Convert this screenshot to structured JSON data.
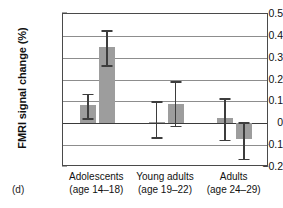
{
  "figure": {
    "panel_letter": "(d)",
    "ylabel": "FMRI signal change (%)"
  },
  "axis": {
    "y_ticks": [
      "0.5",
      "0.4",
      "0.3",
      "0.2",
      "0.1",
      "0",
      "−0.1",
      "−0.2"
    ]
  },
  "categories": [
    {
      "name": "Adolescents",
      "age": "(age 14–18)"
    },
    {
      "name": "Young adults",
      "age": "(age 19–22)"
    },
    {
      "name": "Adults",
      "age": "(age 24–29)"
    }
  ],
  "chart_data": {
    "type": "bar",
    "title": "",
    "xlabel": "",
    "ylabel": "FMRI signal change (%)",
    "ylim": [
      -0.2,
      0.5
    ],
    "ytick_values": [
      0.5,
      0.4,
      0.3,
      0.2,
      0.1,
      0,
      -0.1,
      -0.2
    ],
    "grid": true,
    "legend": "none",
    "categories": [
      "Adolescents (age 14–18)",
      "Young adults (age 19–22)",
      "Adults (age 24–29)"
    ],
    "series": [
      {
        "name": "bar 1",
        "values": [
          0.085,
          0.005,
          0.025
        ],
        "error_low": [
          0.022,
          -0.065,
          -0.075
        ],
        "error_high": [
          0.135,
          0.1,
          0.115
        ]
      },
      {
        "name": "bar 2",
        "values": [
          0.35,
          0.09,
          -0.07
        ],
        "error_low": [
          0.265,
          -0.012,
          -0.162
        ],
        "error_high": [
          0.425,
          0.192,
          0.005
        ]
      }
    ],
    "bar_color": "#9d9d9d",
    "error_color": "#3d3d3d"
  }
}
